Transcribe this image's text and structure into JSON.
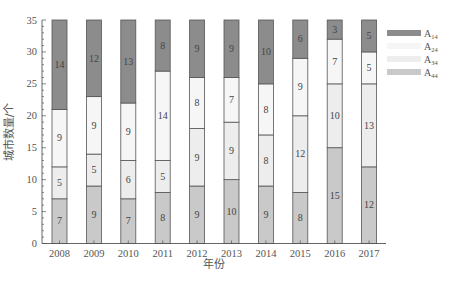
{
  "chart_data": {
    "type": "bar",
    "stacked": true,
    "title": "",
    "xlabel": "年份",
    "ylabel": "城市数量/个",
    "ylim": [
      0,
      35
    ],
    "yticks": [
      0,
      5,
      10,
      15,
      20,
      25,
      30,
      35
    ],
    "grid": false,
    "legend_position": "right",
    "categories": [
      "2008",
      "2009",
      "2010",
      "2011",
      "2012",
      "2013",
      "2014",
      "2015",
      "2016",
      "2017"
    ],
    "series": [
      {
        "name": "A44",
        "label_main": "A",
        "label_sub": "44",
        "color": "#c9c9c9",
        "values": [
          7,
          9,
          7,
          8,
          9,
          10,
          9,
          8,
          15,
          12
        ]
      },
      {
        "name": "A34",
        "label_main": "A",
        "label_sub": "34",
        "color": "#ededed",
        "values": [
          5,
          5,
          6,
          5,
          9,
          9,
          8,
          12,
          10,
          13
        ]
      },
      {
        "name": "A24",
        "label_main": "A",
        "label_sub": "24",
        "color": "#f6f6f6",
        "values": [
          9,
          9,
          9,
          14,
          8,
          7,
          8,
          9,
          7,
          5
        ]
      },
      {
        "name": "A14",
        "label_main": "A",
        "label_sub": "14",
        "color": "#8c8c8c",
        "values": [
          14,
          12,
          13,
          8,
          9,
          9,
          10,
          6,
          3,
          5
        ]
      }
    ]
  },
  "legend_order": [
    "A14",
    "A24",
    "A34",
    "A44"
  ]
}
